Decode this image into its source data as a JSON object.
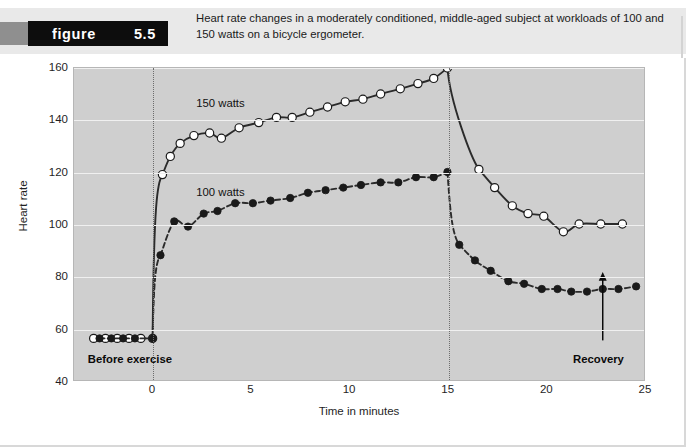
{
  "figure": {
    "word": "figure",
    "number": "5.5",
    "caption": "Heart rate changes in a moderately conditioned, middle-aged subject at workloads of 100 and 150 watts on a bicycle ergometer."
  },
  "annotations": {
    "before_exercise": "Before exercise",
    "recovery": "Recovery",
    "label_150": "150 watts",
    "label_100": "100 watts"
  },
  "colors": {
    "plot_background": "#cfcfcf",
    "gridline": "#f0f0f0",
    "curve": "#2b2b2b",
    "marker_open_fill": "#ffffff",
    "marker_closed_fill": "#1a1a1a",
    "figure_box": "#0d0d0d",
    "header_band": "#e9e9e9"
  },
  "chart_data": {
    "type": "line",
    "title": "Heart rate changes in a moderately conditioned, middle-aged subject at workloads of 100 and 150 watts on a bicycle ergometer.",
    "xlabel": "Time in minutes",
    "ylabel": "Heart rate",
    "xlim": [
      -4,
      25
    ],
    "ylim": [
      40,
      160
    ],
    "xticks": [
      0,
      5,
      10,
      15,
      20,
      25
    ],
    "yticks": [
      40,
      60,
      80,
      100,
      120,
      140,
      160
    ],
    "grid": true,
    "legend_position": "inline-labels",
    "vertical_markers": [
      0,
      15
    ],
    "phases": {
      "rest_end": 0,
      "exercise_end": 15,
      "recovery_end": 25
    },
    "series": [
      {
        "name": "150 watts",
        "marker": "open-circle",
        "line_style": "solid",
        "points": [
          {
            "x": -3.0,
            "y": 56
          },
          {
            "x": -2.4,
            "y": 56
          },
          {
            "x": -1.8,
            "y": 56
          },
          {
            "x": -1.2,
            "y": 56
          },
          {
            "x": -0.6,
            "y": 56
          },
          {
            "x": 0.0,
            "y": 56
          },
          {
            "x": 0.5,
            "y": 119
          },
          {
            "x": 0.9,
            "y": 126
          },
          {
            "x": 1.4,
            "y": 131
          },
          {
            "x": 2.1,
            "y": 134
          },
          {
            "x": 2.9,
            "y": 135
          },
          {
            "x": 3.5,
            "y": 133
          },
          {
            "x": 4.4,
            "y": 137
          },
          {
            "x": 5.4,
            "y": 139
          },
          {
            "x": 6.3,
            "y": 141
          },
          {
            "x": 7.1,
            "y": 141
          },
          {
            "x": 8.0,
            "y": 143
          },
          {
            "x": 8.9,
            "y": 145
          },
          {
            "x": 9.8,
            "y": 147
          },
          {
            "x": 10.7,
            "y": 148
          },
          {
            "x": 11.6,
            "y": 150
          },
          {
            "x": 12.6,
            "y": 152
          },
          {
            "x": 13.5,
            "y": 154
          },
          {
            "x": 14.3,
            "y": 156
          },
          {
            "x": 15.0,
            "y": 160
          },
          {
            "x": 16.6,
            "y": 121
          },
          {
            "x": 17.4,
            "y": 114
          },
          {
            "x": 18.3,
            "y": 107
          },
          {
            "x": 19.1,
            "y": 104
          },
          {
            "x": 19.9,
            "y": 103
          },
          {
            "x": 20.9,
            "y": 97
          },
          {
            "x": 21.7,
            "y": 100
          },
          {
            "x": 22.8,
            "y": 100
          },
          {
            "x": 23.9,
            "y": 100
          }
        ]
      },
      {
        "name": "100 watts",
        "marker": "filled-circle",
        "line_style": "dashed",
        "points": [
          {
            "x": -2.7,
            "y": 56
          },
          {
            "x": -2.1,
            "y": 56
          },
          {
            "x": -1.5,
            "y": 56
          },
          {
            "x": -0.9,
            "y": 56
          },
          {
            "x": 0.0,
            "y": 56
          },
          {
            "x": 0.4,
            "y": 88
          },
          {
            "x": 1.1,
            "y": 101
          },
          {
            "x": 1.8,
            "y": 99
          },
          {
            "x": 2.6,
            "y": 104
          },
          {
            "x": 3.3,
            "y": 105
          },
          {
            "x": 4.2,
            "y": 108
          },
          {
            "x": 5.1,
            "y": 108
          },
          {
            "x": 6.0,
            "y": 109
          },
          {
            "x": 7.0,
            "y": 110
          },
          {
            "x": 7.9,
            "y": 112
          },
          {
            "x": 8.8,
            "y": 113
          },
          {
            "x": 9.7,
            "y": 114
          },
          {
            "x": 10.6,
            "y": 115
          },
          {
            "x": 11.6,
            "y": 116
          },
          {
            "x": 12.5,
            "y": 116
          },
          {
            "x": 13.4,
            "y": 118
          },
          {
            "x": 14.3,
            "y": 118
          },
          {
            "x": 15.0,
            "y": 120
          },
          {
            "x": 15.6,
            "y": 92
          },
          {
            "x": 16.4,
            "y": 86
          },
          {
            "x": 17.2,
            "y": 82
          },
          {
            "x": 18.1,
            "y": 78
          },
          {
            "x": 18.9,
            "y": 77
          },
          {
            "x": 19.8,
            "y": 75
          },
          {
            "x": 20.6,
            "y": 75
          },
          {
            "x": 21.3,
            "y": 74
          },
          {
            "x": 22.1,
            "y": 74
          },
          {
            "x": 22.9,
            "y": 75
          },
          {
            "x": 23.7,
            "y": 75
          },
          {
            "x": 24.6,
            "y": 76
          }
        ]
      }
    ]
  }
}
